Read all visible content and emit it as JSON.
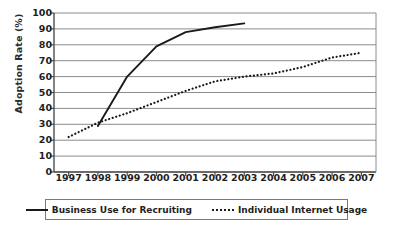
{
  "chart_data": {
    "type": "line",
    "title": "",
    "xlabel": "",
    "ylabel": "Adoption Rate (%)",
    "xlim": [
      1996.5,
      2007.5
    ],
    "ylim": [
      0,
      100
    ],
    "grid": true,
    "legend_position": "bottom",
    "x": [
      1997,
      1998,
      1999,
      2000,
      2001,
      2002,
      2003,
      2004,
      2005,
      2006,
      2007
    ],
    "xtick_labels": [
      "1997",
      "1998",
      "1999",
      "2000",
      "2001",
      "2002",
      "2003",
      "2004",
      "2005",
      "2006",
      "2007"
    ],
    "ytick_labels": [
      "0",
      "10",
      "20",
      "30",
      "40",
      "50",
      "60",
      "70",
      "80",
      "90",
      "100"
    ],
    "ytick_values": [
      0,
      10,
      20,
      30,
      40,
      50,
      60,
      70,
      80,
      90,
      100
    ],
    "series": [
      {
        "name": "Business Use for Recruiting",
        "style": "solid",
        "color": "#1a1a1a",
        "x": [
          1998,
          1999,
          2000,
          2001,
          2002,
          2003
        ],
        "values": [
          29,
          60,
          79,
          88,
          91,
          93.5
        ]
      },
      {
        "name": "Individual Internet Usage",
        "style": "dotted",
        "color": "#1a1a1a",
        "x": [
          1997,
          1998,
          1999,
          2000,
          2001,
          2002,
          2003,
          2004,
          2005,
          2006,
          2007
        ],
        "values": [
          22,
          31,
          37,
          44,
          51,
          57,
          60,
          62,
          66,
          72,
          75
        ]
      }
    ]
  },
  "axes": {
    "y_title": "Adoption Rate (%)"
  },
  "legend": {
    "items": [
      {
        "label": "Business Use for Recruiting",
        "style": "solid"
      },
      {
        "label": "Individual Internet Usage",
        "style": "dotted"
      }
    ]
  },
  "colors": {
    "line": "#1a1a1a",
    "grid": "#8c8c8c",
    "axis": "#4d4d4d",
    "text": "#1e1e1e",
    "background": "#ffffff"
  }
}
